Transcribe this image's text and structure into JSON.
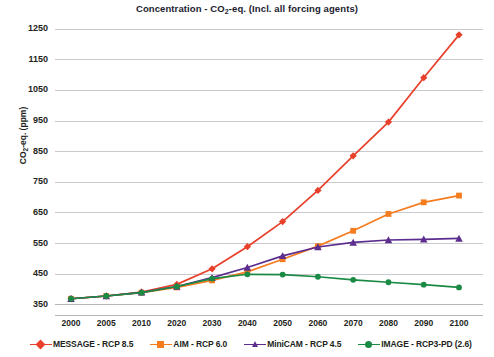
{
  "chart_data": {
    "type": "line",
    "title": "Concentration - CO2-eq. (Incl. all forcing agents)",
    "title_parts": {
      "pre": "Concentration - CO",
      "sub": "2",
      "post": "-eq. (Incl. all forcing agents)"
    },
    "xlabel": "",
    "ylabel": "CO2-eq. (ppm)",
    "ylabel_parts": {
      "pre": "CO",
      "sub": "2",
      "post": "-eq. (ppm)"
    },
    "x": [
      2000,
      2005,
      2010,
      2020,
      2030,
      2040,
      2050,
      2060,
      2070,
      2080,
      2090,
      2100
    ],
    "xticklabels": [
      "2000",
      "2005",
      "2010",
      "2020",
      "2030",
      "2040",
      "2050",
      "2060",
      "2070",
      "2080",
      "2090",
      "2100"
    ],
    "yticks": [
      350,
      450,
      550,
      650,
      750,
      850,
      950,
      1050,
      1150,
      1250
    ],
    "yticklabels": [
      "350",
      "450",
      "550",
      "650",
      "750",
      "850",
      "950",
      "1050",
      "1150",
      "1250"
    ],
    "ylim": [
      315,
      1285
    ],
    "xlim": [
      1998,
      2102
    ],
    "grid": true,
    "legend_position": "bottom",
    "series": [
      {
        "name": "MESSAGE - RCP 8.5",
        "color": "#e8402a",
        "marker": "diamond",
        "values": [
          368,
          377,
          390,
          415,
          466,
          538,
          620,
          722,
          835,
          945,
          1090,
          1230
        ]
      },
      {
        "name": "AIM - RCP 6.0",
        "color": "#f57c1f",
        "marker": "square",
        "values": [
          368,
          377,
          388,
          405,
          428,
          456,
          497,
          540,
          590,
          645,
          683,
          705
        ]
      },
      {
        "name": "MiniCAM - RCP 4.5",
        "color": "#5b2d8e",
        "marker": "triangle",
        "values": [
          368,
          377,
          389,
          408,
          437,
          470,
          508,
          537,
          552,
          560,
          562,
          565
        ]
      },
      {
        "name": "IMAGE - RCP3-PD (2.6)",
        "color": "#1a8a44",
        "marker": "circle",
        "values": [
          368,
          377,
          388,
          408,
          434,
          448,
          447,
          440,
          430,
          422,
          414,
          405
        ]
      }
    ]
  },
  "legend": {
    "items": [
      {
        "label": "MESSAGE - RCP 8.5",
        "color": "#e8402a",
        "marker": "diamond"
      },
      {
        "label": "AIM - RCP 6.0",
        "color": "#f57c1f",
        "marker": "square"
      },
      {
        "label": "MiniCAM - RCP 4.5",
        "color": "#5b2d8e",
        "marker": "triangle"
      },
      {
        "label": "IMAGE - RCP3-PD (2.6)",
        "color": "#1a8a44",
        "marker": "circle"
      }
    ]
  }
}
